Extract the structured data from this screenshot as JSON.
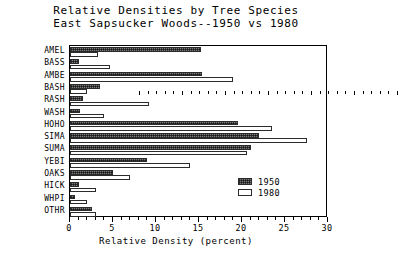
{
  "chart_data": {
    "type": "bar",
    "orientation": "horizontal",
    "title": "Relative Densities by Tree Species",
    "subtitle": "East Sapsucker Woods--1950 vs 1980",
    "xlabel": "Relative Density  (percent)",
    "ylabel": "",
    "xlim": [
      0,
      30
    ],
    "xticks": [
      0,
      5,
      10,
      15,
      20,
      25,
      30
    ],
    "xtick_labels": [
      "0",
      "5",
      "10",
      "15",
      "20",
      "25",
      "30"
    ],
    "xtick_minor_step": 1,
    "grid": false,
    "legend_position": "lower right",
    "categories": [
      "AMEL",
      "BASS",
      "AMBE",
      "BASH",
      "RASH",
      "WASH",
      "HOHO",
      "SIMA",
      "SUMA",
      "YEBI",
      "OAKS",
      "HICK",
      "WHPI",
      "OTHR"
    ],
    "series": [
      {
        "name": "1950",
        "fill": "hatched-gray",
        "values": [
          15.2,
          1.0,
          15.3,
          3.5,
          1.5,
          1.2,
          19.5,
          22.0,
          21.0,
          9.0,
          5.0,
          1.0,
          0.6,
          2.6
        ]
      },
      {
        "name": "1980",
        "fill": "white",
        "values": [
          3.2,
          4.6,
          19.0,
          2.0,
          9.2,
          4.0,
          23.5,
          27.5,
          20.6,
          14.0,
          7.0,
          3.0,
          2.0,
          3.0
        ]
      }
    ]
  },
  "legend": {
    "entries": [
      {
        "label": "1950",
        "swatch": "hatched-gray-swatch"
      },
      {
        "label": "1980",
        "swatch": "white-swatch"
      }
    ]
  },
  "colors": {
    "axis": "#000000",
    "bar_1950": "#7a7a7a",
    "bar_1980": "#ffffff",
    "bar_edge": "#2b2b2b",
    "background": "#ffffff"
  }
}
